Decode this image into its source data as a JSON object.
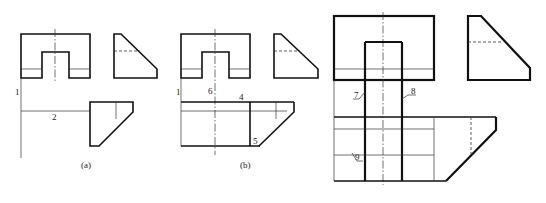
{
  "figure": {
    "panels": [
      {
        "id": "a",
        "caption": "(a)",
        "labels": [
          "1",
          "2"
        ]
      },
      {
        "id": "b",
        "caption": "(b)",
        "labels": [
          "1",
          "6",
          "4",
          "5"
        ]
      },
      {
        "id": "c",
        "caption": "",
        "labels": [
          "7",
          "8",
          "9"
        ]
      }
    ]
  },
  "labels": {
    "a1": "1",
    "a2": "2",
    "a_caption": "(a)",
    "b1": "1",
    "b6": "6",
    "b4": "4",
    "b5": "5",
    "b_caption": "(b)",
    "c7": "7",
    "c8": "8",
    "c9": "9"
  },
  "colors": {
    "line": "#111111",
    "background": "#ffffff"
  }
}
